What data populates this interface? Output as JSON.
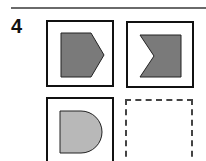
{
  "question": {
    "number": "4"
  },
  "puzzle": {
    "cells": [
      {
        "shape": "pentagon-arrow-right",
        "fill": "#7a7a7a"
      },
      {
        "shape": "notched-square-left",
        "fill": "#7a7a7a"
      },
      {
        "shape": "half-disc-right",
        "fill": "#b8b8b8"
      },
      {
        "shape": "empty-answer-slot"
      }
    ]
  }
}
